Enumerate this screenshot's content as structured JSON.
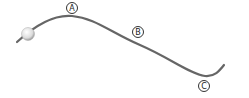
{
  "diagram": {
    "track_color": "#666666",
    "ball_color": "#e6e6e6",
    "points": [
      {
        "label": "A",
        "x": 72,
        "y": 7
      },
      {
        "label": "B",
        "x": 137,
        "y": 33
      },
      {
        "label": "C",
        "x": 204,
        "y": 87
      }
    ]
  }
}
